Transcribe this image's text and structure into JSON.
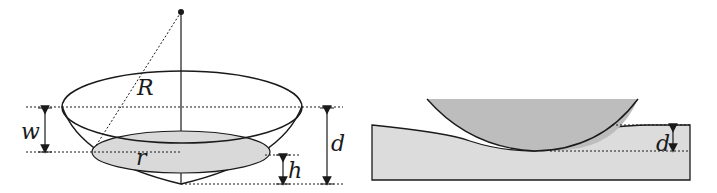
{
  "left_figure": {
    "title": "spherical cap indentation geometry",
    "labels": {
      "R": "R",
      "w": "w",
      "d": "d",
      "r": "r",
      "h": "h"
    },
    "colors": {
      "stroke": "#1a1a1a",
      "contact_fill": "#d9d9d9",
      "background": "#ffffff"
    }
  },
  "right_figure": {
    "title": "sphere pressing into flat substrate",
    "labels": {
      "d": "d"
    },
    "colors": {
      "sphere_fill": "#bdbdbd",
      "substrate_fill": "#dcdcdc",
      "stroke": "#1a1a1a"
    }
  }
}
